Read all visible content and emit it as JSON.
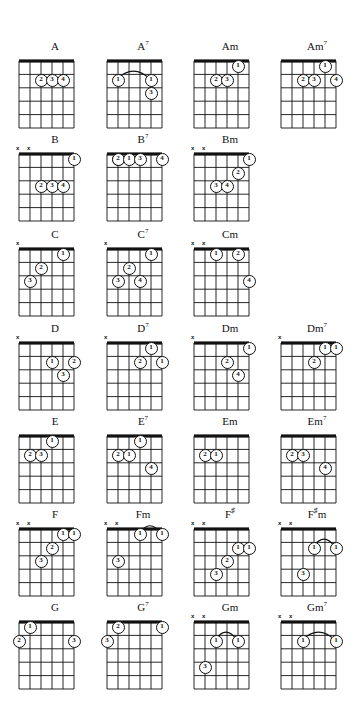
{
  "page": {
    "columns": 4,
    "rows": 7,
    "strings": 6,
    "frets": 5,
    "colors": {
      "ink": "#111111",
      "paper": "#ffffff"
    },
    "legend": {
      "mute_symbol": "x",
      "finger_numbers": [
        "1",
        "2",
        "3",
        "4"
      ]
    }
  },
  "chords": [
    {
      "name": "A",
      "root": "A",
      "suffix": "",
      "col": 0,
      "row": 0,
      "mutes": [],
      "dots": [
        {
          "string": 4,
          "fret": 2,
          "finger": "2"
        },
        {
          "string": 3,
          "fret": 2,
          "finger": "3"
        },
        {
          "string": 2,
          "fret": 2,
          "finger": "4"
        }
      ],
      "barre": null
    },
    {
      "name": "A7",
      "root": "A",
      "suffix": "7",
      "col": 1,
      "row": 0,
      "mutes": [],
      "dots": [
        {
          "string": 5,
          "fret": 2,
          "finger": "1"
        },
        {
          "string": 2,
          "fret": 2,
          "finger": "1"
        },
        {
          "string": 2,
          "fret": 3,
          "finger": "3"
        }
      ],
      "barre": {
        "fret": 2,
        "from_string": 5,
        "to_string": 2
      }
    },
    {
      "name": "Am",
      "root": "A",
      "suffix": "m",
      "col": 2,
      "row": 0,
      "mutes": [],
      "dots": [
        {
          "string": 2,
          "fret": 1,
          "finger": "1"
        },
        {
          "string": 4,
          "fret": 2,
          "finger": "2"
        },
        {
          "string": 3,
          "fret": 2,
          "finger": "3"
        }
      ],
      "barre": null
    },
    {
      "name": "Am7",
      "root": "A",
      "suffix": "m7",
      "col": 3,
      "row": 0,
      "mutes": [],
      "dots": [
        {
          "string": 2,
          "fret": 1,
          "finger": "1"
        },
        {
          "string": 4,
          "fret": 2,
          "finger": "2"
        },
        {
          "string": 3,
          "fret": 2,
          "finger": "3"
        },
        {
          "string": 1,
          "fret": 2,
          "finger": "4"
        }
      ],
      "barre": null
    },
    {
      "name": "B",
      "root": "B",
      "suffix": "",
      "col": 0,
      "row": 1,
      "mutes": [
        6,
        5
      ],
      "dots": [
        {
          "string": 1,
          "fret": 1,
          "finger": "1"
        },
        {
          "string": 4,
          "fret": 3,
          "finger": "2"
        },
        {
          "string": 3,
          "fret": 3,
          "finger": "3"
        },
        {
          "string": 2,
          "fret": 3,
          "finger": "4"
        }
      ],
      "barre": null
    },
    {
      "name": "B7",
      "root": "B",
      "suffix": "7",
      "col": 1,
      "row": 1,
      "mutes": [],
      "dots": [
        {
          "string": 5,
          "fret": 1,
          "finger": "2"
        },
        {
          "string": 5,
          "fret": 1,
          "finger": "2"
        },
        {
          "string": 4,
          "fret": 1,
          "finger": "1"
        },
        {
          "string": 3,
          "fret": 1,
          "finger": "3"
        },
        {
          "string": 1,
          "fret": 1,
          "finger": "4"
        }
      ],
      "barre": null
    },
    {
      "name": "Bm",
      "root": "B",
      "suffix": "m",
      "col": 2,
      "row": 1,
      "mutes": [
        6,
        5
      ],
      "dots": [
        {
          "string": 1,
          "fret": 1,
          "finger": "1"
        },
        {
          "string": 2,
          "fret": 2,
          "finger": "2"
        },
        {
          "string": 4,
          "fret": 3,
          "finger": "3"
        },
        {
          "string": 3,
          "fret": 3,
          "finger": "4"
        }
      ],
      "barre": null
    },
    {
      "name": "C",
      "root": "C",
      "suffix": "",
      "col": 0,
      "row": 2,
      "mutes": [
        6
      ],
      "dots": [
        {
          "string": 2,
          "fret": 1,
          "finger": "1"
        },
        {
          "string": 4,
          "fret": 2,
          "finger": "2"
        },
        {
          "string": 5,
          "fret": 3,
          "finger": "3"
        }
      ],
      "barre": null
    },
    {
      "name": "C7",
      "root": "C",
      "suffix": "7",
      "col": 1,
      "row": 2,
      "mutes": [
        6
      ],
      "dots": [
        {
          "string": 2,
          "fret": 1,
          "finger": "1"
        },
        {
          "string": 4,
          "fret": 2,
          "finger": "2"
        },
        {
          "string": 5,
          "fret": 3,
          "finger": "3"
        },
        {
          "string": 3,
          "fret": 3,
          "finger": "4"
        }
      ],
      "barre": null
    },
    {
      "name": "Cm",
      "root": "C",
      "suffix": "m",
      "col": 2,
      "row": 2,
      "mutes": [
        6,
        5
      ],
      "dots": [
        {
          "string": 4,
          "fret": 1,
          "finger": "1"
        },
        {
          "string": 2,
          "fret": 1,
          "finger": "2"
        },
        {
          "string": 1,
          "fret": 3,
          "finger": "4"
        }
      ],
      "barre": null
    },
    {
      "name": "D",
      "root": "D",
      "suffix": "",
      "col": 0,
      "row": 3,
      "mutes": [
        6
      ],
      "dots": [
        {
          "string": 3,
          "fret": 2,
          "finger": "1"
        },
        {
          "string": 1,
          "fret": 2,
          "finger": "2"
        },
        {
          "string": 2,
          "fret": 3,
          "finger": "3"
        }
      ],
      "barre": null
    },
    {
      "name": "D7",
      "root": "D",
      "suffix": "7",
      "col": 1,
      "row": 3,
      "mutes": [
        6
      ],
      "dots": [
        {
          "string": 2,
          "fret": 1,
          "finger": "1"
        },
        {
          "string": 3,
          "fret": 2,
          "finger": "2"
        },
        {
          "string": 1,
          "fret": 2,
          "finger": "1"
        }
      ],
      "barre": null
    },
    {
      "name": "Dm",
      "root": "D",
      "suffix": "m",
      "col": 2,
      "row": 3,
      "mutes": [
        6
      ],
      "dots": [
        {
          "string": 1,
          "fret": 1,
          "finger": "1"
        },
        {
          "string": 3,
          "fret": 2,
          "finger": "2"
        },
        {
          "string": 2,
          "fret": 3,
          "finger": "4"
        }
      ],
      "barre": null
    },
    {
      "name": "Dm7",
      "root": "D",
      "suffix": "m7",
      "col": 3,
      "row": 3,
      "mutes": [
        6
      ],
      "dots": [
        {
          "string": 2,
          "fret": 1,
          "finger": "1"
        },
        {
          "string": 1,
          "fret": 1,
          "finger": "1"
        },
        {
          "string": 3,
          "fret": 2,
          "finger": "2"
        }
      ],
      "barre": {
        "fret": 1,
        "from_string": 2,
        "to_string": 1
      }
    },
    {
      "name": "E",
      "root": "E",
      "suffix": "",
      "col": 0,
      "row": 4,
      "mutes": [],
      "dots": [
        {
          "string": 3,
          "fret": 1,
          "finger": "1"
        },
        {
          "string": 5,
          "fret": 2,
          "finger": "2"
        },
        {
          "string": 4,
          "fret": 2,
          "finger": "3"
        }
      ],
      "barre": null
    },
    {
      "name": "E7",
      "root": "E",
      "suffix": "7",
      "col": 1,
      "row": 4,
      "mutes": [],
      "dots": [
        {
          "string": 3,
          "fret": 1,
          "finger": "1"
        },
        {
          "string": 5,
          "fret": 2,
          "finger": "2"
        },
        {
          "string": 4,
          "fret": 2,
          "finger": "1"
        },
        {
          "string": 2,
          "fret": 3,
          "finger": "4"
        }
      ],
      "barre": null
    },
    {
      "name": "Em",
      "root": "E",
      "suffix": "m",
      "col": 2,
      "row": 4,
      "mutes": [],
      "dots": [
        {
          "string": 5,
          "fret": 2,
          "finger": "2"
        },
        {
          "string": 4,
          "fret": 2,
          "finger": "1"
        }
      ],
      "barre": null
    },
    {
      "name": "Em7",
      "root": "E",
      "suffix": "m7",
      "col": 3,
      "row": 4,
      "mutes": [],
      "dots": [
        {
          "string": 5,
          "fret": 2,
          "finger": "2"
        },
        {
          "string": 4,
          "fret": 2,
          "finger": "3"
        },
        {
          "string": 2,
          "fret": 3,
          "finger": "4"
        }
      ],
      "barre": null
    },
    {
      "name": "F",
      "root": "F",
      "suffix": "",
      "col": 0,
      "row": 5,
      "mutes": [
        6,
        5
      ],
      "dots": [
        {
          "string": 2,
          "fret": 1,
          "finger": "1"
        },
        {
          "string": 1,
          "fret": 1,
          "finger": "1"
        },
        {
          "string": 3,
          "fret": 2,
          "finger": "2"
        },
        {
          "string": 4,
          "fret": 3,
          "finger": "3"
        }
      ],
      "barre": {
        "fret": 1,
        "from_string": 2,
        "to_string": 1
      }
    },
    {
      "name": "Fm",
      "root": "F",
      "suffix": "m",
      "col": 1,
      "row": 5,
      "mutes": [
        6,
        5
      ],
      "dots": [
        {
          "string": 3,
          "fret": 1,
          "finger": "1"
        },
        {
          "string": 1,
          "fret": 1,
          "finger": "1"
        },
        {
          "string": 5,
          "fret": 3,
          "finger": "3"
        }
      ],
      "barre": {
        "fret": 1,
        "from_string": 3,
        "to_string": 1
      }
    },
    {
      "name": "F#",
      "root": "F",
      "suffix": "#",
      "col": 2,
      "row": 5,
      "mutes": [
        6,
        5
      ],
      "dots": [
        {
          "string": 2,
          "fret": 2,
          "finger": "1"
        },
        {
          "string": 1,
          "fret": 2,
          "finger": "1"
        },
        {
          "string": 3,
          "fret": 3,
          "finger": "2"
        },
        {
          "string": 4,
          "fret": 4,
          "finger": "3"
        }
      ],
      "barre": null
    },
    {
      "name": "F#m",
      "root": "F",
      "suffix": "#m",
      "col": 3,
      "row": 5,
      "mutes": [
        6,
        5
      ],
      "dots": [
        {
          "string": 3,
          "fret": 2,
          "finger": "1"
        },
        {
          "string": 1,
          "fret": 2,
          "finger": "1"
        },
        {
          "string": 4,
          "fret": 4,
          "finger": "3"
        }
      ],
      "barre": {
        "fret": 2,
        "from_string": 3,
        "to_string": 1
      }
    },
    {
      "name": "G",
      "root": "G",
      "suffix": "",
      "col": 0,
      "row": 6,
      "mutes": [],
      "dots": [
        {
          "string": 5,
          "fret": 1,
          "finger": "1"
        },
        {
          "string": 6,
          "fret": 2,
          "finger": "2"
        },
        {
          "string": 1,
          "fret": 2,
          "finger": "3"
        }
      ],
      "barre": null
    },
    {
      "name": "G7",
      "root": "G",
      "suffix": "7",
      "col": 1,
      "row": 6,
      "mutes": [],
      "dots": [
        {
          "string": 1,
          "fret": 1,
          "finger": "1"
        },
        {
          "string": 5,
          "fret": 1,
          "finger": "2"
        },
        {
          "string": 6,
          "fret": 2,
          "finger": "3"
        }
      ],
      "barre": null
    },
    {
      "name": "Gm",
      "root": "G",
      "suffix": "m",
      "col": 2,
      "row": 6,
      "mutes": [
        6,
        5
      ],
      "dots": [
        {
          "string": 4,
          "fret": 2,
          "finger": "1"
        },
        {
          "string": 2,
          "fret": 2,
          "finger": "1"
        },
        {
          "string": 5,
          "fret": 4,
          "finger": "3"
        }
      ],
      "barre": {
        "fret": 2,
        "from_string": 4,
        "to_string": 2
      }
    },
    {
      "name": "Gm7",
      "root": "G",
      "suffix": "m7",
      "col": 3,
      "row": 6,
      "mutes": [
        6,
        5
      ],
      "dots": [
        {
          "string": 4,
          "fret": 2,
          "finger": "1"
        },
        {
          "string": 1,
          "fret": 2,
          "finger": "1"
        }
      ],
      "barre": {
        "fret": 2,
        "from_string": 4,
        "to_string": 1
      }
    }
  ]
}
